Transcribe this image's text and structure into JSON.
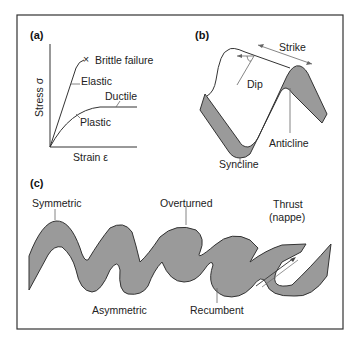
{
  "figure": {
    "border_color": "#333333",
    "fill_color": "#9a9a9a",
    "panels": {
      "a": {
        "tag": "(a)",
        "y_axis_label": "Stress σ",
        "x_axis_label": "Strain ε",
        "curves": [
          "Elastic",
          "Plastic"
        ],
        "labels": {
          "brittle": "Brittle failure",
          "elastic": "Elastic",
          "ductile": "Ductile",
          "plastic": "Plastic"
        },
        "markers": {
          "brittle_marker": "×"
        }
      },
      "b": {
        "tag": "(b)",
        "labels": {
          "strike": "Strike",
          "dip": "Dip",
          "anticline": "Anticline",
          "syncline": "Syncline"
        }
      },
      "c": {
        "tag": "(c)",
        "labels": {
          "symmetric": "Symmetric",
          "overturned": "Overturned",
          "thrust_line1": "Thrust",
          "thrust_line2": "(nappe)",
          "asymmetric": "Asymmetric",
          "recumbent": "Recumbent"
        }
      }
    }
  }
}
